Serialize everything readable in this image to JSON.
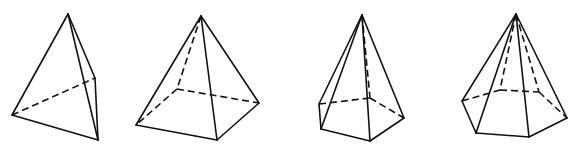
{
  "figure": {
    "stroke_color": "#111111",
    "background": "#ffffff",
    "shapes": [
      {
        "name": "triangular-pyramid",
        "apex": [
          68,
          14
        ],
        "vertices": {
          "left": [
            12,
            115
          ],
          "front": [
            98,
            140
          ],
          "back": [
            95,
            78
          ]
        },
        "solid_edges": [
          [
            "apex",
            "left"
          ],
          [
            "apex",
            "front"
          ],
          [
            "apex",
            "back"
          ],
          [
            "left",
            "front"
          ],
          [
            "front",
            "back"
          ]
        ],
        "dashed_edges": [
          [
            "left",
            "back"
          ]
        ]
      },
      {
        "name": "square-pyramid",
        "apex": [
          201,
          16
        ],
        "vertices": {
          "left": [
            136,
            125
          ],
          "front": [
            217,
            140
          ],
          "right": [
            259,
            103
          ],
          "back": [
            177,
            89
          ]
        },
        "solid_edges": [
          [
            "apex",
            "left"
          ],
          [
            "apex",
            "front"
          ],
          [
            "apex",
            "right"
          ],
          [
            "left",
            "front"
          ],
          [
            "front",
            "right"
          ]
        ],
        "dashed_edges": [
          [
            "apex",
            "back"
          ],
          [
            "back",
            "left"
          ],
          [
            "back",
            "right"
          ]
        ]
      },
      {
        "name": "pentagonal-pyramid",
        "apex": [
          362,
          15
        ],
        "vertices": {
          "a": [
            319,
            104
          ],
          "b": [
            321,
            129
          ],
          "c": [
            370,
            141
          ],
          "d": [
            404,
            118
          ],
          "e": [
            370,
            98
          ]
        },
        "solid_edges": [
          [
            "apex",
            "a"
          ],
          [
            "apex",
            "b"
          ],
          [
            "apex",
            "c"
          ],
          [
            "apex",
            "d"
          ],
          [
            "a",
            "b"
          ],
          [
            "b",
            "c"
          ],
          [
            "c",
            "d"
          ]
        ],
        "dashed_edges": [
          [
            "apex",
            "e"
          ],
          [
            "a",
            "e"
          ],
          [
            "e",
            "d"
          ]
        ]
      },
      {
        "name": "hexagonal-pyramid",
        "apex": [
          516,
          14
        ],
        "vertices": {
          "l": [
            462,
            101
          ],
          "fl": [
            476,
            133
          ],
          "fr": [
            529,
            137
          ],
          "r": [
            567,
            118
          ],
          "br": [
            539,
            92
          ],
          "bl": [
            500,
            90
          ]
        },
        "solid_edges": [
          [
            "apex",
            "l"
          ],
          [
            "apex",
            "fl"
          ],
          [
            "apex",
            "fr"
          ],
          [
            "apex",
            "r"
          ],
          [
            "l",
            "fl"
          ],
          [
            "fl",
            "fr"
          ],
          [
            "fr",
            "r"
          ]
        ],
        "dashed_edges": [
          [
            "apex",
            "bl"
          ],
          [
            "apex",
            "br"
          ],
          [
            "l",
            "bl"
          ],
          [
            "bl",
            "br"
          ],
          [
            "br",
            "r"
          ]
        ]
      }
    ]
  }
}
